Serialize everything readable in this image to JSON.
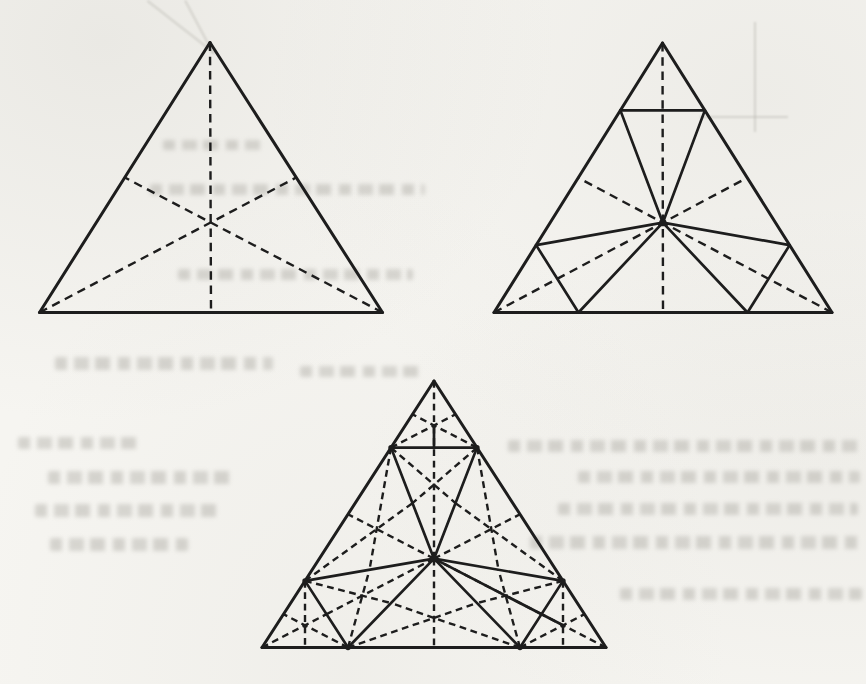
{
  "page": {
    "background_color": "#f6f5f1",
    "ink_color": "#1d1d1d",
    "width": 866,
    "height": 684
  },
  "style": {
    "outline_width": 3.0,
    "solid_width": 2.7,
    "dashed_width": 2.4,
    "dash_large": [
      8.5,
      5.8
    ],
    "dash_small": [
      6.8,
      4.6
    ],
    "dot_radius": 2.7,
    "hub_dot_radius": 3.7
  },
  "figures": [
    {
      "name": "triangle-with-dashed-medians",
      "vertices": {
        "A": [
          210,
          42.5
        ],
        "B": [
          39.5,
          312.5
        ],
        "C": [
          382.5,
          312.5
        ]
      },
      "quarter_ratio": 0.25,
      "medians_dashed": true,
      "fold_triangles_solid": false,
      "sub_medians_dashed": false,
      "dash": "large",
      "dots": [],
      "extra_solid": []
    },
    {
      "name": "triangle-first-fold-pattern",
      "vertices": {
        "A": [
          662.5,
          43
        ],
        "B": [
          494,
          312.5
        ],
        "C": [
          832,
          312.5
        ]
      },
      "quarter_ratio": 0.25,
      "medians_dashed": true,
      "fold_triangles_solid": true,
      "sub_medians_dashed": false,
      "dash": "large",
      "dots": [
        "G"
      ],
      "extra_solid": []
    },
    {
      "name": "triangle-second-fold-pattern",
      "vertices": {
        "A": [
          434,
          381
        ],
        "B": [
          262,
          647.5
        ],
        "C": [
          606,
          647.5
        ]
      },
      "quarter_ratio": 0.25,
      "medians_dashed": false,
      "fold_triangles_solid": true,
      "sub_medians_dashed": true,
      "dash": "small",
      "dots": [
        "G",
        "PA",
        "QA",
        "PB",
        "QB",
        "PC",
        "QC"
      ],
      "extra_solid": [
        [
          "centroid:A,PA,QA",
          "mid:PA,QA"
        ],
        [
          "G",
          "centroid:C,PC,QC"
        ]
      ]
    }
  ],
  "sub_triangles": [
    [
      "A",
      "PA",
      "QA"
    ],
    [
      "PA",
      "QA",
      "G"
    ],
    [
      "B",
      "PB",
      "QB"
    ],
    [
      "PB",
      "QB",
      "G"
    ],
    [
      "C",
      "PC",
      "QC"
    ],
    [
      "PC",
      "QC",
      "G"
    ],
    [
      "PA",
      "PB",
      "G"
    ],
    [
      "QB",
      "QC",
      "G"
    ],
    [
      "QA",
      "PC",
      "G"
    ]
  ],
  "bleed_marks": [
    {
      "x": 150,
      "y": 184,
      "w": 275,
      "h": 11,
      "kind": "words"
    },
    {
      "x": 163,
      "y": 140,
      "w": 98,
      "h": 10,
      "kind": "words"
    },
    {
      "x": 178,
      "y": 269,
      "w": 235,
      "h": 11,
      "kind": "words"
    },
    {
      "x": 55,
      "y": 357,
      "w": 218,
      "h": 13,
      "kind": "words"
    },
    {
      "x": 300,
      "y": 366,
      "w": 120,
      "h": 11,
      "kind": "words"
    },
    {
      "x": 18,
      "y": 437,
      "w": 122,
      "h": 12,
      "kind": "words"
    },
    {
      "x": 48,
      "y": 471,
      "w": 188,
      "h": 13,
      "kind": "words"
    },
    {
      "x": 35,
      "y": 504,
      "w": 182,
      "h": 13,
      "kind": "words"
    },
    {
      "x": 50,
      "y": 538,
      "w": 138,
      "h": 13,
      "kind": "words"
    },
    {
      "x": 508,
      "y": 440,
      "w": 352,
      "h": 12,
      "kind": "words"
    },
    {
      "x": 578,
      "y": 471,
      "w": 282,
      "h": 12,
      "kind": "words"
    },
    {
      "x": 558,
      "y": 503,
      "w": 300,
      "h": 12,
      "kind": "words"
    },
    {
      "x": 530,
      "y": 536,
      "w": 330,
      "h": 13,
      "kind": "words"
    },
    {
      "x": 620,
      "y": 588,
      "w": 242,
      "h": 12,
      "kind": "words"
    },
    {
      "x": 148,
      "y": 0,
      "w": 86,
      "h": 2,
      "rot": 38,
      "kind": "line"
    },
    {
      "x": 186,
      "y": 0,
      "w": 60,
      "h": 2,
      "rot": 62,
      "kind": "line"
    },
    {
      "x": 754,
      "y": 22,
      "w": 2,
      "h": 110,
      "rot": 0,
      "kind": "line"
    },
    {
      "x": 700,
      "y": 116,
      "w": 88,
      "h": 2,
      "rot": 0,
      "kind": "line"
    }
  ]
}
